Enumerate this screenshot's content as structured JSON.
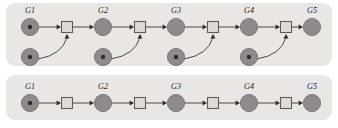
{
  "figure": {
    "width": 338,
    "height": 128,
    "background": "#ffffff",
    "panel_fill": "#e9e7e6",
    "place_fill": "#8e8a8c",
    "place_stroke": "#6d696b",
    "token_fill": "#2b2b2b",
    "transition_fill": "#dedbd9",
    "transition_stroke": "#5f5c5c",
    "arc_color": "#4a4748",
    "label_color": "#1d1b1c"
  },
  "panels": [
    {
      "id": "top-panel",
      "name": "concurrent-petri-net",
      "x": 6,
      "y": 3,
      "width": 326,
      "height": 63,
      "radius": 9,
      "main_row_y": 27,
      "lower_row_y": 57,
      "place_radius": 8.6,
      "token_radius": 2.2,
      "transition_size": 11,
      "places": [
        {
          "label": "G1",
          "cx": 30,
          "cy": 27,
          "token": true,
          "label_x": 30,
          "label_y": 13
        },
        {
          "label": "G2",
          "cx": 103,
          "cy": 27,
          "token": false,
          "label_x": 103,
          "label_y": 13
        },
        {
          "label": "G3",
          "cx": 176,
          "cy": 27,
          "token": false,
          "label_x": 176,
          "label_y": 13
        },
        {
          "label": "G4",
          "cx": 249,
          "cy": 27,
          "token": false,
          "label_x": 249,
          "label_y": 13
        },
        {
          "label": "G5",
          "cx": 312,
          "cy": 27,
          "token": false,
          "label_x": 312,
          "label_y": 13
        }
      ],
      "lower_places": [
        {
          "cx": 30,
          "cy": 57,
          "token": true
        },
        {
          "cx": 103,
          "cy": 57,
          "token": true
        },
        {
          "cx": 176,
          "cy": 57,
          "token": true
        },
        {
          "cx": 249,
          "cy": 57,
          "token": true
        }
      ],
      "transitions": [
        {
          "cx": 67,
          "cy": 27
        },
        {
          "cx": 140,
          "cy": 27
        },
        {
          "cx": 213,
          "cy": 27
        },
        {
          "cx": 286,
          "cy": 27
        }
      ],
      "straight_arcs": [
        {
          "x1": 39,
          "y1": 27,
          "x2": 61,
          "y2": 27
        },
        {
          "x1": 73,
          "y1": 27,
          "x2": 94,
          "y2": 27
        },
        {
          "x1": 112,
          "y1": 27,
          "x2": 134,
          "y2": 27
        },
        {
          "x1": 146,
          "y1": 27,
          "x2": 167,
          "y2": 27
        },
        {
          "x1": 185,
          "y1": 27,
          "x2": 207,
          "y2": 27
        },
        {
          "x1": 219,
          "y1": 27,
          "x2": 240,
          "y2": 27
        },
        {
          "x1": 258,
          "y1": 27,
          "x2": 280,
          "y2": 27
        },
        {
          "x1": 292,
          "y1": 27,
          "x2": 303,
          "y2": 27
        }
      ],
      "curved_arcs": [
        {
          "sx": 38,
          "sy": 59,
          "cx": 62,
          "cy": 55,
          "ex": 67,
          "ey": 34
        },
        {
          "sx": 111,
          "sy": 59,
          "cx": 135,
          "cy": 55,
          "ex": 140,
          "ey": 34
        },
        {
          "sx": 184,
          "sy": 59,
          "cx": 208,
          "cy": 55,
          "ex": 213,
          "ey": 34
        },
        {
          "sx": 257,
          "sy": 59,
          "cx": 281,
          "cy": 55,
          "ex": 286,
          "ey": 34
        }
      ]
    },
    {
      "id": "bottom-panel",
      "name": "sequential-petri-net",
      "x": 6,
      "y": 75,
      "width": 326,
      "height": 45,
      "radius": 9,
      "main_row_y": 103,
      "place_radius": 8.6,
      "token_radius": 2.2,
      "transition_size": 11,
      "places": [
        {
          "label": "G1",
          "cx": 30,
          "cy": 103,
          "token": true,
          "label_x": 30,
          "label_y": 89
        },
        {
          "label": "G2",
          "cx": 103,
          "cy": 103,
          "token": false,
          "label_x": 103,
          "label_y": 89
        },
        {
          "label": "G3",
          "cx": 176,
          "cy": 103,
          "token": false,
          "label_x": 176,
          "label_y": 89
        },
        {
          "label": "G4",
          "cx": 249,
          "cy": 103,
          "token": false,
          "label_x": 249,
          "label_y": 89
        },
        {
          "label": "G5",
          "cx": 312,
          "cy": 103,
          "token": false,
          "label_x": 312,
          "label_y": 89
        }
      ],
      "lower_places": [],
      "transitions": [
        {
          "cx": 67,
          "cy": 103
        },
        {
          "cx": 140,
          "cy": 103
        },
        {
          "cx": 213,
          "cy": 103
        },
        {
          "cx": 286,
          "cy": 103
        }
      ],
      "straight_arcs": [
        {
          "x1": 39,
          "y1": 103,
          "x2": 61,
          "y2": 103
        },
        {
          "x1": 73,
          "y1": 103,
          "x2": 94,
          "y2": 103
        },
        {
          "x1": 112,
          "y1": 103,
          "x2": 134,
          "y2": 103
        },
        {
          "x1": 146,
          "y1": 103,
          "x2": 167,
          "y2": 103
        },
        {
          "x1": 185,
          "y1": 103,
          "x2": 207,
          "y2": 103
        },
        {
          "x1": 219,
          "y1": 103,
          "x2": 240,
          "y2": 103
        },
        {
          "x1": 258,
          "y1": 103,
          "x2": 280,
          "y2": 103
        },
        {
          "x1": 292,
          "y1": 103,
          "x2": 303,
          "y2": 103
        }
      ],
      "curved_arcs": []
    }
  ]
}
